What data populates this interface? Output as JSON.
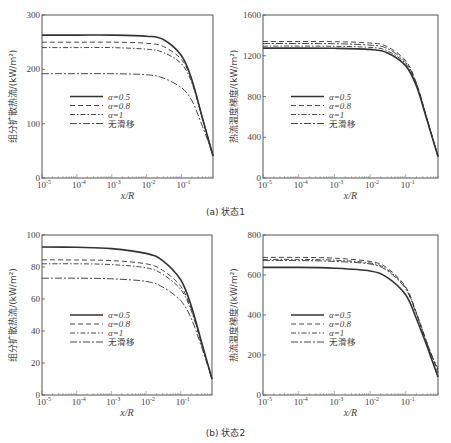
{
  "figure": {
    "captions": [
      "(a) 状态1",
      "(b) 状态2"
    ]
  },
  "legend": {
    "entries": [
      {
        "label": "α=0.5",
        "style": "solid"
      },
      {
        "label": "α=0.8",
        "style": "dashed"
      },
      {
        "label": "α=1",
        "style": "dashdot"
      },
      {
        "label": "无滑移",
        "style": "longdash-dot"
      }
    ]
  },
  "chart_data": [
    {
      "id": "a-left",
      "panel": "(a) 状态1",
      "type": "line",
      "title": "",
      "xlabel": "x/R",
      "ylabel": "组分扩散热流/(kW/m²)",
      "xscale": "log",
      "xlim": [
        1e-05,
        0.8
      ],
      "ylim": [
        0,
        300
      ],
      "xticks": [
        "10^-5",
        "10^-4",
        "10^-3",
        "10^-2",
        "10^-1"
      ],
      "yticks": [
        0,
        100,
        200,
        300
      ],
      "grid": false,
      "legend_position": "center-left",
      "x": [
        1e-05,
        0.0001,
        0.001,
        0.01,
        0.03,
        0.1,
        0.2,
        0.4,
        0.8
      ],
      "series": [
        {
          "name": "α=0.5",
          "style": "solid",
          "values": [
            263,
            263,
            263,
            261,
            255,
            225,
            180,
            110,
            40
          ]
        },
        {
          "name": "α=0.8",
          "style": "dashed",
          "values": [
            250,
            250,
            250,
            248,
            242,
            218,
            178,
            110,
            42
          ]
        },
        {
          "name": "α=1",
          "style": "dashdot",
          "values": [
            240,
            240,
            240,
            237,
            231,
            210,
            174,
            108,
            42
          ]
        },
        {
          "name": "无滑移",
          "style": "longdash-dot",
          "values": [
            192,
            192,
            192,
            190,
            184,
            166,
            142,
            95,
            42
          ]
        }
      ]
    },
    {
      "id": "a-right",
      "panel": "(a) 状态1",
      "type": "line",
      "title": "",
      "xlabel": "x/R",
      "ylabel": "热流温度梯度/(kW/m²)",
      "xscale": "log",
      "xlim": [
        1e-05,
        0.8
      ],
      "ylim": [
        0,
        1600
      ],
      "xticks": [
        "10^-5",
        "10^-4",
        "10^-3",
        "10^-2",
        "10^-1"
      ],
      "yticks": [
        0,
        400,
        800,
        1200,
        1600
      ],
      "grid": false,
      "legend_position": "center-left",
      "x": [
        1e-05,
        0.0001,
        0.001,
        0.01,
        0.03,
        0.1,
        0.2,
        0.4,
        0.8
      ],
      "series": [
        {
          "name": "α=0.5",
          "style": "solid",
          "values": [
            1275,
            1275,
            1273,
            1262,
            1230,
            1100,
            900,
            560,
            210
          ]
        },
        {
          "name": "α=0.8",
          "style": "dashed",
          "values": [
            1340,
            1340,
            1338,
            1325,
            1290,
            1150,
            930,
            575,
            215
          ]
        },
        {
          "name": "α=1",
          "style": "dashdot",
          "values": [
            1295,
            1295,
            1293,
            1282,
            1250,
            1120,
            915,
            568,
            212
          ]
        },
        {
          "name": "无滑移",
          "style": "longdash-dot",
          "values": [
            1320,
            1320,
            1318,
            1305,
            1272,
            1135,
            922,
            570,
            214
          ]
        }
      ]
    },
    {
      "id": "b-left",
      "panel": "(b) 状态2",
      "type": "line",
      "title": "",
      "xlabel": "x/R",
      "ylabel": "组分扩散热流/(kW/m²)",
      "xscale": "log",
      "xlim": [
        1e-05,
        0.8
      ],
      "ylim": [
        0,
        100
      ],
      "xticks": [
        "10^-5",
        "10^-4",
        "10^-3",
        "10^-2",
        "10^-1"
      ],
      "yticks": [
        0,
        20,
        40,
        60,
        80,
        100
      ],
      "grid": false,
      "legend_position": "center-left",
      "x": [
        1e-05,
        0.0001,
        0.001,
        0.01,
        0.03,
        0.1,
        0.2,
        0.4,
        0.8
      ],
      "series": [
        {
          "name": "α=0.5",
          "style": "solid",
          "values": [
            92.5,
            92.3,
            91.5,
            88.5,
            84,
            72,
            56,
            33,
            10
          ]
        },
        {
          "name": "α=0.8",
          "style": "dashed",
          "values": [
            84.5,
            84.4,
            84,
            82,
            78,
            68,
            54,
            32,
            10
          ]
        },
        {
          "name": "α=1",
          "style": "dashdot",
          "values": [
            82,
            82,
            81.5,
            79.5,
            75.5,
            66,
            53,
            32,
            10
          ]
        },
        {
          "name": "无滑移",
          "style": "longdash-dot",
          "values": [
            73,
            73,
            72.6,
            71,
            67.5,
            59,
            48,
            30,
            10
          ]
        }
      ]
    },
    {
      "id": "b-right",
      "panel": "(b) 状态2",
      "type": "line",
      "title": "",
      "xlabel": "x/R",
      "ylabel": "热流温度梯度/(kW/m²)",
      "xscale": "log",
      "xlim": [
        1e-05,
        0.8
      ],
      "ylim": [
        0,
        800
      ],
      "xticks": [
        "10^-5",
        "10^-4",
        "10^-3",
        "10^-2",
        "10^-1"
      ],
      "yticks": [
        0,
        200,
        400,
        600,
        800
      ],
      "grid": false,
      "legend_position": "center-left",
      "x": [
        1e-05,
        0.0001,
        0.001,
        0.01,
        0.03,
        0.1,
        0.2,
        0.4,
        0.8
      ],
      "series": [
        {
          "name": "α=0.5",
          "style": "solid",
          "values": [
            638,
            638,
            634,
            620,
            588,
            500,
            380,
            240,
            90
          ]
        },
        {
          "name": "α=0.8",
          "style": "dashed",
          "values": [
            688,
            688,
            684,
            668,
            635,
            540,
            410,
            258,
            110
          ]
        },
        {
          "name": "α=1",
          "style": "dashdot",
          "values": [
            678,
            678,
            674,
            660,
            628,
            535,
            406,
            255,
            120
          ]
        },
        {
          "name": "无滑移",
          "style": "longdash-dot",
          "values": [
            672,
            672,
            668,
            655,
            622,
            530,
            402,
            252,
            130
          ]
        }
      ]
    }
  ]
}
